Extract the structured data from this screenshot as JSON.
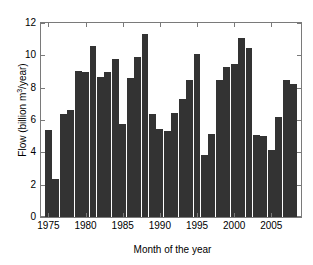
{
  "chart_data": {
    "type": "bar",
    "title": "",
    "xlabel": "Month of the year",
    "ylabel": "Flow (billion m3/year)",
    "ylabel_parts": {
      "pre": "Flow (billion m",
      "sup": "3",
      "post": "/year)"
    },
    "xlim": [
      1974,
      2009
    ],
    "ylim": [
      0,
      12
    ],
    "ytick_labels": [
      "0",
      "2",
      "4",
      "6",
      "8",
      "10",
      "12"
    ],
    "ytick_values": [
      0,
      2,
      4,
      6,
      8,
      10,
      12
    ],
    "xtick_labels": [
      "1975",
      "1980",
      "1985",
      "1990",
      "1995",
      "2000",
      "2005"
    ],
    "xtick_values": [
      1975,
      1980,
      1985,
      1990,
      1995,
      2000,
      2005
    ],
    "grid": false,
    "legend": null,
    "bar_color": "#333333",
    "axis_color": "#7a7a7a",
    "categories": [
      1975,
      1976,
      1977,
      1978,
      1979,
      1980,
      1981,
      1982,
      1983,
      1984,
      1985,
      1986,
      1987,
      1988,
      1989,
      1990,
      1991,
      1992,
      1993,
      1994,
      1995,
      1996,
      1997,
      1998,
      1999,
      2000,
      2001,
      2002,
      2003,
      2004,
      2005,
      2006,
      2007,
      2008
    ],
    "values": [
      5.4,
      2.35,
      6.4,
      6.6,
      9.05,
      8.95,
      10.6,
      8.65,
      9.0,
      9.8,
      5.75,
      8.6,
      9.9,
      11.3,
      6.4,
      5.45,
      5.35,
      6.45,
      7.3,
      8.5,
      10.1,
      3.85,
      5.15,
      8.5,
      9.25,
      9.45,
      11.1,
      10.45,
      5.1,
      5.0,
      4.15,
      6.2,
      8.45,
      8.2
    ]
  }
}
